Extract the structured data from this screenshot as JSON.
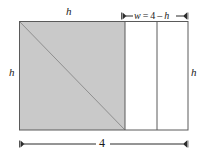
{
  "figure": {
    "colors": {
      "shaded_fill": "#c9c9c9",
      "outline": "#4d4d4d",
      "diagonal": "#8a8a8a",
      "dimension_line": "#2b2b2b",
      "background": "#ffffff"
    },
    "labels": {
      "top_height": "h",
      "left_height": "h",
      "right_height": "h",
      "bottom_width": "4",
      "width_expression": {
        "variable": "w",
        "equals": "=",
        "total": "4",
        "minus": "–",
        "subtracted": "h",
        "full_text": "w = 4 – h"
      }
    },
    "geometry": {
      "outer_rect": {
        "x": 19,
        "y": 21,
        "width": 169,
        "height": 109
      },
      "shaded_square": {
        "x": 19,
        "y": 21,
        "width": 106,
        "height": 109
      },
      "divider_line_x": 157,
      "diagonal": {
        "x1": 19,
        "y1": 21,
        "x2": 125,
        "y2": 130
      },
      "top_dimension": {
        "x1": 122,
        "x2": 190,
        "y": 16
      },
      "bottom_dimension": {
        "x1": 19,
        "x2": 188,
        "y": 144
      }
    }
  }
}
